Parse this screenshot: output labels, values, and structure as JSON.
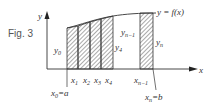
{
  "figure": {
    "caption": "Fig. 3",
    "curve_label": "y = f(x)",
    "axis_x_label": "x",
    "axis_y_label": "y",
    "ordinates": {
      "y0": "y",
      "y0_sub": "0",
      "y4": "y",
      "y4_sub": "4",
      "yn1": "y",
      "yn1_sub": "n−1",
      "yn": "y",
      "yn_sub": "n"
    },
    "abscissas": {
      "x1": "x",
      "x1_sub": "1",
      "x2": "x",
      "x2_sub": "2",
      "x3": "x",
      "x3_sub": "3",
      "x4": "x",
      "x4_sub": "4",
      "xn1": "x",
      "xn1_sub": "n−1",
      "x0": "x",
      "x0_sub": "0",
      "x0_eq": "=a",
      "xn": "x",
      "xn_sub": "n",
      "xn_eq": "=b"
    },
    "colors": {
      "stroke": "#333333",
      "hatch": "#444444",
      "caption": "#555555"
    }
  }
}
